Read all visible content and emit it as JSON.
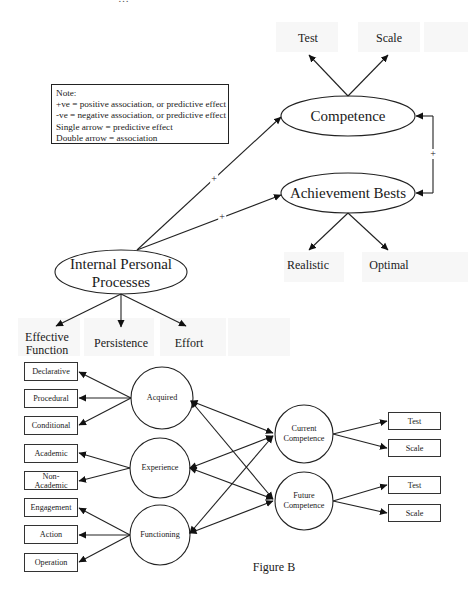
{
  "page": {
    "truncated_header_text": "…",
    "figure_caption": "Figure B"
  },
  "note": {
    "title": "Note:",
    "lines": [
      "+ve = positive association, or predictive effect",
      "-ve = negative association, or predictive effect",
      "Single arrow = predictive effect",
      "Double arrow = association"
    ]
  },
  "figure_a": {
    "nodes": {
      "competence": "Competence",
      "achievement_bests": "Achievement Bests",
      "internal_personal_processes_line1": "Internal Personal",
      "internal_personal_processes_line2": "Processes"
    },
    "indicators": {
      "competence_test": "Test",
      "competence_scale": "Scale",
      "achievement_realistic": "Realistic",
      "achievement_optimal": "Optimal",
      "ipp_effective_function_line1": "Effective",
      "ipp_effective_function_line2": "Function",
      "ipp_persistence": "Persistence",
      "ipp_effort": "Effort"
    },
    "path_signs": {
      "ipp_to_competence": "+",
      "ipp_to_achievement": "+",
      "competence_achievement_association": "+"
    }
  },
  "figure_b": {
    "latent": {
      "acquired": "Acquired",
      "experience": "Experience",
      "functioning": "Functioning",
      "current_competence_line1": "Current",
      "current_competence_line2": "Competence",
      "future_competence_line1": "Future",
      "future_competence_line2": "Competence"
    },
    "left_indicators": {
      "declarative": "Declarative",
      "procedural": "Procedural",
      "conditional": "Conditional",
      "academic": "Academic",
      "non_academic_line1": "Non-",
      "non_academic_line2": "Academic",
      "engagement": "Engagement",
      "action": "Action",
      "operation": "Operation"
    },
    "right_indicators": {
      "current_test": "Test",
      "current_scale": "Scale",
      "future_test": "Test",
      "future_scale": "Scale"
    }
  },
  "colors": {
    "ink": "#1a1a1a",
    "background": "#ffffff",
    "ghost": "#f7f7f7"
  }
}
